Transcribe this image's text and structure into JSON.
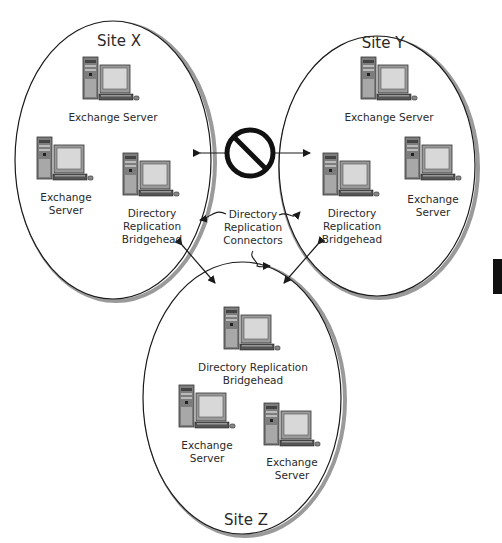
{
  "diagram": {
    "type": "site-topology",
    "colors": {
      "line": "#1a1a1a",
      "shadow": "#9a9a9a",
      "pc_case": "#8a8a8a",
      "screen": "#d4d4d4",
      "text": "#2a2a2a"
    },
    "sites": [
      {
        "id": "site-x",
        "label": "Site X",
        "nodes": [
          {
            "label": "Exchange Server",
            "icon": "computer-icon"
          },
          {
            "label": "Exchange Server",
            "icon": "computer-icon"
          },
          {
            "label": "Directory Replication Bridgehead",
            "icon": "computer-icon"
          }
        ]
      },
      {
        "id": "site-y",
        "label": "Site Y",
        "nodes": [
          {
            "label": "Exchange Server",
            "icon": "computer-icon"
          },
          {
            "label": "Directory Replication Bridgehead",
            "icon": "computer-icon"
          },
          {
            "label": "Exchange Server",
            "icon": "computer-icon"
          }
        ]
      },
      {
        "id": "site-z",
        "label": "Site Z",
        "nodes": [
          {
            "label": "Directory Replication Bridgehead",
            "icon": "computer-icon"
          },
          {
            "label": "Exchange Server",
            "icon": "computer-icon"
          },
          {
            "label": "Exchange Server",
            "icon": "computer-icon"
          }
        ]
      }
    ],
    "connections": [
      {
        "from": "site-x",
        "to": "site-y",
        "blocked": true,
        "icon": "prohibited-icon"
      },
      {
        "from": "site-x",
        "to": "site-z",
        "blocked": false
      },
      {
        "from": "site-y",
        "to": "site-z",
        "blocked": false
      }
    ],
    "annotation": {
      "line1": "Directory",
      "line2": "Replication",
      "line3": "Connectors"
    }
  },
  "labels": {
    "x_top": "Exchange Server",
    "x_left_1": "Exchange",
    "x_left_2": "Server",
    "x_bh_1": "Directory",
    "x_bh_2": "Replication",
    "x_bh_3": "Bridgehead",
    "y_top": "Exchange Server",
    "y_bh_1": "Directory",
    "y_bh_2": "Replication",
    "y_bh_3": "Bridgehead",
    "y_right_1": "Exchange",
    "y_right_2": "Server",
    "z_bh_1": "Directory Replication",
    "z_bh_2": "Bridgehead",
    "z_left_1": "Exchange",
    "z_left_2": "Server",
    "z_right_1": "Exchange",
    "z_right_2": "Server"
  }
}
